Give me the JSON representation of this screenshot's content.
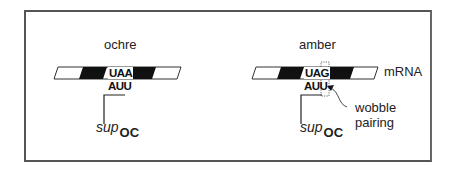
{
  "panels": [
    {
      "id": "ochre",
      "title": "ochre",
      "codon": "UAA",
      "anticodon": "AUU",
      "suppressor": {
        "base": "sup",
        "subscript": "OC"
      }
    },
    {
      "id": "amber",
      "title": "amber",
      "codon": "UAG",
      "anticodon": "AUU",
      "suppressor": {
        "base": "sup",
        "subscript": "OC"
      },
      "strand_label": "mRNA",
      "annotation": [
        "wobble",
        "pairing"
      ]
    }
  ],
  "colors": {
    "frame": "#555555",
    "ink": "#222222",
    "fill_dark": "#111111",
    "fill_light": "#ffffff"
  }
}
